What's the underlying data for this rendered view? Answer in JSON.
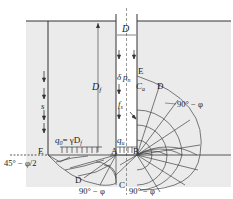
{
  "figure": {
    "type": "pile bearing capacity failure mechanism",
    "colors": {
      "soil": "#ebebeb",
      "line": "#333333",
      "background": "#ffffff"
    },
    "labels": {
      "diameter": "D",
      "depth": "D",
      "depth_sub": "f",
      "settlement": "s",
      "q0": "q",
      "q0_sub": "0",
      "q0_eq": "= γD",
      "q0_eq_sub": "f",
      "qu": "q",
      "qu_sub": "u",
      "fs": "f",
      "fs_sub": "s",
      "delta": "δ",
      "pn": "p",
      "pn_sub": "n",
      "ca": "C",
      "ca_sub": "a",
      "point_E_left": "E",
      "point_E_right": "E",
      "point_A": "A",
      "point_B": "B",
      "point_C": "C",
      "point_D_left": "D",
      "point_D_right": "D",
      "angle_45": "45° − φ/2",
      "angle_90_right_top": "90° − φ",
      "angle_90_bottom_left": "90° − φ",
      "angle_90_bottom_right": "90° − φ"
    }
  }
}
